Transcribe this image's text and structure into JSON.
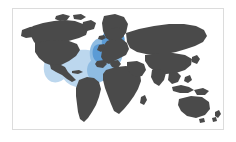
{
  "figure": {
    "type": "world-map-choropleth",
    "has_text": false,
    "frame": {
      "visible": true,
      "color": "#dcdcdc",
      "style": "thin-rectangle"
    },
    "background_color": "#ffffff"
  },
  "map": {
    "projection": "equirectangular",
    "land_color": "#4a4a4a",
    "ocean_color": "#ffffff",
    "labels": [],
    "legend": null,
    "title": null,
    "caption": null,
    "highlight": {
      "description": "North Atlantic and Western Europe emphasis",
      "colors": {
        "deep": "#5b9bd5",
        "mid": "#8fbce2",
        "pale": "#bcd7ee"
      },
      "regions": [
        {
          "name": "northern-europe-scandinavia",
          "intensity": "deep"
        },
        {
          "name": "western-europe",
          "intensity": "mid"
        },
        {
          "name": "iberia-mediterranean",
          "intensity": "mid"
        },
        {
          "name": "north-atlantic-ocean",
          "intensity": "pale"
        },
        {
          "name": "us-east-coast",
          "intensity": "pale"
        }
      ]
    },
    "continents": [
      {
        "name": "north-america",
        "highlighted": true
      },
      {
        "name": "south-america",
        "highlighted": false
      },
      {
        "name": "europe",
        "highlighted": true
      },
      {
        "name": "africa",
        "highlighted": false
      },
      {
        "name": "asia",
        "highlighted": false
      },
      {
        "name": "australia",
        "highlighted": false
      },
      {
        "name": "greenland",
        "highlighted": false
      }
    ]
  }
}
